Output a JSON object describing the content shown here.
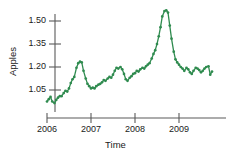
{
  "chart_data": {
    "type": "line",
    "title": "",
    "xlabel": "Time",
    "ylabel": "Apples",
    "grid": false,
    "legend": false,
    "legend_position": "none",
    "line_color": "#2f8b4f",
    "marker": "circle",
    "marker_color": "#2f8b4f",
    "xlim": [
      2005.92,
      2009.92
    ],
    "ylim": [
      0.94,
      1.595
    ],
    "xticks": [
      2006,
      2007,
      2008,
      2009
    ],
    "xtick_labels": [
      "2006",
      "2007",
      "2008",
      "2009"
    ],
    "yticks": [
      1.05,
      1.2,
      1.35,
      1.5
    ],
    "ytick_labels": [
      "1.05",
      "1.20",
      "1.35",
      "1.50"
    ],
    "series": [
      {
        "name": "Apples",
        "x": [
          2006.0,
          2006.04,
          2006.08,
          2006.12,
          2006.17,
          2006.21,
          2006.25,
          2006.29,
          2006.33,
          2006.38,
          2006.42,
          2006.46,
          2006.5,
          2006.54,
          2006.58,
          2006.62,
          2006.67,
          2006.71,
          2006.75,
          2006.79,
          2006.83,
          2006.88,
          2006.92,
          2006.96,
          2007.0,
          2007.04,
          2007.08,
          2007.12,
          2007.17,
          2007.21,
          2007.25,
          2007.29,
          2007.33,
          2007.38,
          2007.42,
          2007.46,
          2007.5,
          2007.54,
          2007.58,
          2007.62,
          2007.67,
          2007.71,
          2007.75,
          2007.79,
          2007.83,
          2007.88,
          2007.92,
          2007.96,
          2008.0,
          2008.04,
          2008.08,
          2008.12,
          2008.17,
          2008.21,
          2008.25,
          2008.29,
          2008.33,
          2008.38,
          2008.42,
          2008.46,
          2008.5,
          2008.54,
          2008.58,
          2008.62,
          2008.67,
          2008.71,
          2008.75,
          2008.79,
          2008.83,
          2008.88,
          2008.92,
          2008.96,
          2009.0,
          2009.04,
          2009.08,
          2009.12,
          2009.17,
          2009.21,
          2009.25,
          2009.29,
          2009.33,
          2009.38,
          2009.42,
          2009.46,
          2009.5,
          2009.54,
          2009.58,
          2009.62,
          2009.67,
          2009.71,
          2009.75
        ],
        "y": [
          0.975,
          0.99,
          1.005,
          0.975,
          0.965,
          0.985,
          1.0,
          1.01,
          1.01,
          1.03,
          1.045,
          1.04,
          1.06,
          1.095,
          1.12,
          1.135,
          1.195,
          1.225,
          1.235,
          1.23,
          1.175,
          1.125,
          1.09,
          1.075,
          1.06,
          1.065,
          1.06,
          1.075,
          1.085,
          1.09,
          1.1,
          1.115,
          1.11,
          1.125,
          1.135,
          1.13,
          1.15,
          1.175,
          1.195,
          1.19,
          1.2,
          1.185,
          1.155,
          1.12,
          1.11,
          1.13,
          1.14,
          1.155,
          1.16,
          1.175,
          1.17,
          1.185,
          1.195,
          1.19,
          1.205,
          1.215,
          1.225,
          1.255,
          1.285,
          1.31,
          1.35,
          1.4,
          1.46,
          1.53,
          1.565,
          1.57,
          1.555,
          1.47,
          1.385,
          1.3,
          1.25,
          1.23,
          1.215,
          1.2,
          1.19,
          1.175,
          1.195,
          1.185,
          1.165,
          1.155,
          1.175,
          1.195,
          1.19,
          1.18,
          1.165,
          1.175,
          1.19,
          1.2,
          1.205,
          1.15,
          1.17
        ]
      }
    ]
  },
  "axes": {
    "ylabel": "Apples",
    "xlabel": "Time"
  }
}
